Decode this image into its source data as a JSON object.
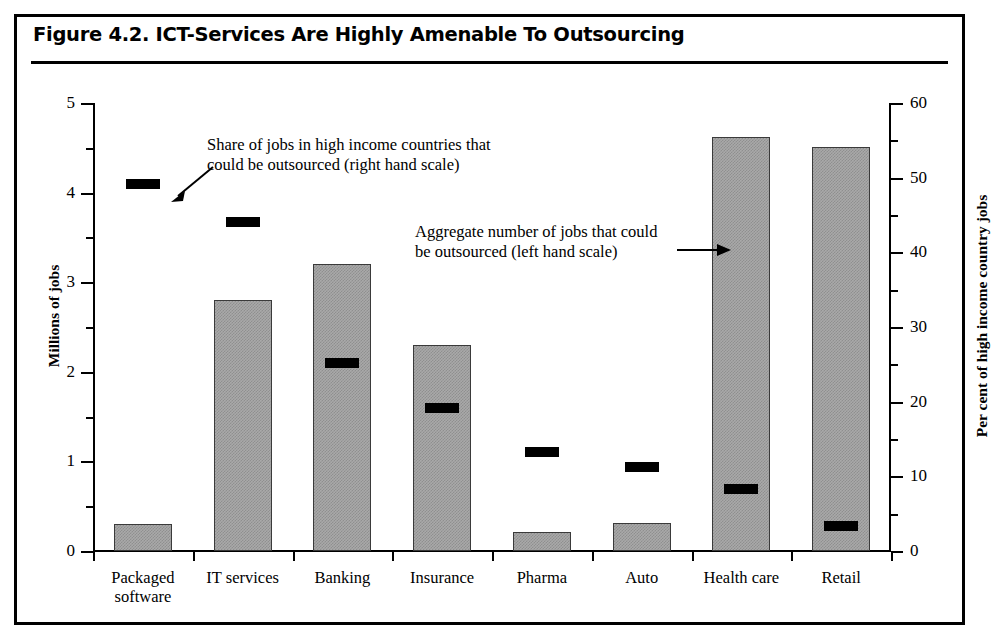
{
  "figure": {
    "title": "Figure 4.2.  ICT-Services Are Highly Amenable To Outsourcing"
  },
  "annotations": {
    "share": {
      "line1": "Share of jobs in high income countries that",
      "line2": "could be outsourced (right hand scale)",
      "arrow": "arrow-down-left-icon"
    },
    "aggregate": {
      "line1": "Aggregate number of jobs that could",
      "line2": "be outsourced (left hand scale)",
      "arrow": "arrow-right-icon"
    }
  },
  "chart_data": {
    "type": "bar",
    "title": "Figure 4.2.  ICT-Services Are Highly Amenable To Outsourcing",
    "xlabel": "",
    "ylabel": "Millions of jobs",
    "y2label": "Per cent of high income country jobs",
    "ylim": [
      0,
      5
    ],
    "y2lim": [
      0,
      60
    ],
    "yticks": [
      0,
      1,
      2,
      3,
      4,
      5
    ],
    "yticklabels": [
      "0",
      "1",
      "2",
      "3",
      "4",
      "5"
    ],
    "y2ticks": [
      0,
      10,
      20,
      30,
      40,
      50,
      60
    ],
    "y2ticklabels": [
      "0",
      "10",
      "20",
      "30",
      "40",
      "50",
      "60"
    ],
    "yminorticks": [
      0.5,
      1.5,
      2.5,
      3.5,
      4.5
    ],
    "y2minorticks": [
      5,
      15,
      25,
      35,
      45,
      55
    ],
    "grid": false,
    "legend": "annotations",
    "categories": [
      "Packaged software",
      "IT services",
      "Banking",
      "Insurance",
      "Pharma",
      "Auto",
      "Health care",
      "Retail"
    ],
    "category_label_lines": [
      [
        "Packaged",
        "software"
      ],
      [
        "IT services"
      ],
      [
        "Banking"
      ],
      [
        "Insurance"
      ],
      [
        "Pharma"
      ],
      [
        "Auto"
      ],
      [
        "Health care"
      ],
      [
        "Retail"
      ]
    ],
    "series": [
      {
        "name": "Aggregate number of jobs that could be outsourced (left hand scale)",
        "axis": "left",
        "unit": "Millions of jobs",
        "render": "bar",
        "color": "#a9a9a9",
        "values": [
          0.3,
          2.8,
          3.2,
          2.3,
          0.21,
          0.31,
          4.62,
          4.51
        ]
      },
      {
        "name": "Share of jobs in high income countries that could be outsourced (right hand scale)",
        "axis": "right",
        "unit": "Per cent of high income country jobs",
        "render": "marker",
        "color": "#000000",
        "values": [
          49.2,
          44.1,
          25.2,
          19.1,
          13.2,
          11.3,
          8.3,
          3.3
        ]
      }
    ]
  }
}
